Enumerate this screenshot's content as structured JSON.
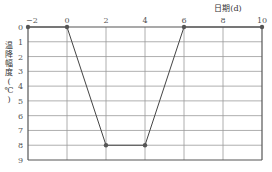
{
  "chart_data": {
    "type": "line",
    "title": "",
    "xlabel": "日期(d)",
    "ylabel": "温降幅度(℃)",
    "x": [
      -2,
      0,
      2,
      4,
      6,
      10
    ],
    "series": [
      {
        "name": "温降幅度",
        "values": [
          0,
          0,
          8,
          8,
          0,
          0
        ]
      }
    ],
    "x_ticks": [
      "−2",
      "0",
      "2",
      "4",
      "6",
      "8",
      "10"
    ],
    "x_tick_values": [
      -2,
      0,
      2,
      4,
      6,
      8,
      10
    ],
    "y_ticks": [
      "0",
      "1",
      "2",
      "3",
      "4",
      "5",
      "6",
      "7",
      "8",
      "9"
    ],
    "y_tick_values": [
      0,
      1,
      2,
      3,
      4,
      5,
      6,
      7,
      8,
      9
    ],
    "xlim": [
      -2,
      10
    ],
    "ylim": [
      0,
      9
    ],
    "y_inverted": true,
    "x_axis_position": "top",
    "grid": true,
    "legend": null
  },
  "colors": {
    "line": "#444444",
    "grid": "#9a9a9a",
    "border": "#555555",
    "marker": "#555555"
  }
}
